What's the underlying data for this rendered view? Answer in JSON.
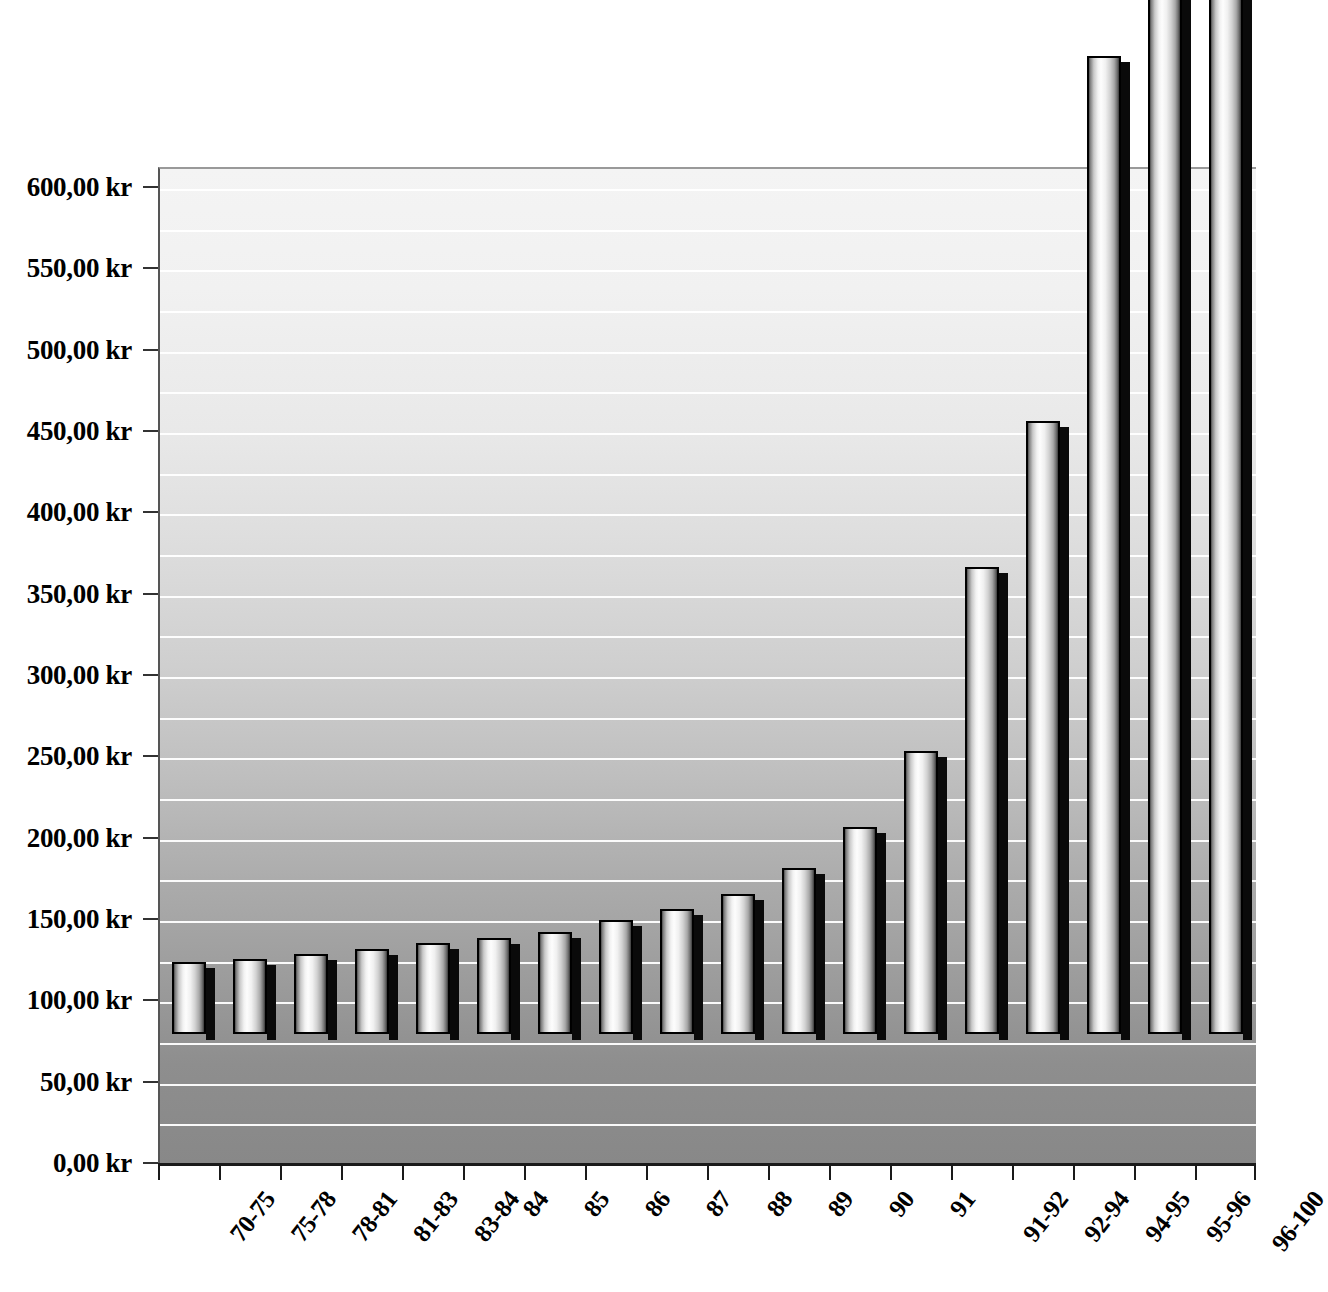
{
  "chart_data": {
    "type": "bar",
    "title": "",
    "subtitle": "",
    "xlabel": "",
    "ylabel": "",
    "currency_suffix": "kr",
    "decimal_separator": ",",
    "categories": [
      "70-75",
      "75-78",
      "78-81",
      "81-83",
      "83-84",
      "84",
      "85",
      "86",
      "87",
      "88",
      "89",
      "90",
      "91",
      "91-92",
      "92-94",
      "94-95",
      "95-96",
      "96-100"
    ],
    "values": [
      44,
      46,
      49,
      52,
      56,
      59,
      63,
      70,
      77,
      86,
      102,
      127,
      174,
      287,
      377,
      601,
      980,
      1010
    ],
    "value_notes": {
      "95-96": "bar extends above the top of the image (clipped)",
      "96-100": "bar extends above the top of the image (clipped)"
    },
    "ylim": [
      0,
      620
    ],
    "y_axis_visible_max": 600,
    "y_tick_step": 50,
    "y_tick_labels": [
      "0,00 kr",
      "50,00 kr",
      "100,00 kr",
      "150,00 kr",
      "200,00 kr",
      "250,00 kr",
      "300,00 kr",
      "350,00 kr",
      "400,00 kr",
      "450,00 kr",
      "500,00 kr",
      "550,00 kr",
      "600,00 kr"
    ],
    "y_tick_values": [
      0,
      50,
      100,
      150,
      200,
      250,
      300,
      350,
      400,
      450,
      500,
      550,
      600
    ],
    "gridlines": {
      "enabled": true,
      "minor_step": 25,
      "color": "#ffffff",
      "orientation": "horizontal"
    },
    "legend": {
      "visible": false,
      "position": "none"
    },
    "series": [
      {
        "name": "",
        "values": [
          44,
          46,
          49,
          52,
          56,
          59,
          63,
          70,
          77,
          86,
          102,
          127,
          174,
          287,
          377,
          601,
          980,
          1010
        ]
      }
    ],
    "style": {
      "bar_style": "3d-cylinder",
      "bar_fill_light": "#fdfdfd",
      "bar_fill_dark": "#3a3a3a",
      "bar_border": "#000000",
      "bar_shadow": "#0a0a0a",
      "plot_bg_top": "#f4f4f4",
      "plot_bg_bottom": "#888888",
      "axis_color": "#1a1a1a",
      "text_color": "#000000"
    }
  }
}
